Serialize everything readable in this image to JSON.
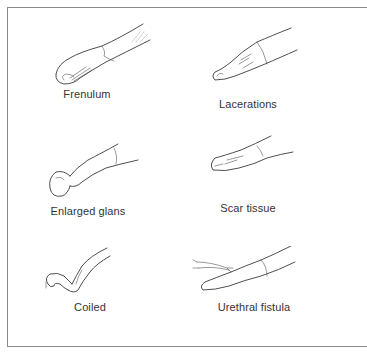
{
  "figure": {
    "panels": [
      {
        "id": "frenulum",
        "label": "Frenulum"
      },
      {
        "id": "lacerations",
        "label": "Lacerations"
      },
      {
        "id": "enlarged-glans",
        "label": "Enlarged glans"
      },
      {
        "id": "scar-tissue",
        "label": "Scar tissue"
      },
      {
        "id": "coiled",
        "label": "Coiled"
      },
      {
        "id": "urethral-fistula",
        "label": "Urethral fistula"
      }
    ]
  }
}
